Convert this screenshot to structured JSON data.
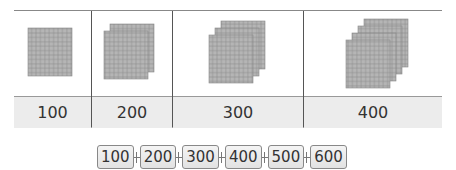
{
  "table": {
    "columns": [
      {
        "label": "100",
        "flats": 1
      },
      {
        "label": "200",
        "flats": 2
      },
      {
        "label": "300",
        "flats": 3
      },
      {
        "label": "400",
        "flats": 4
      }
    ]
  },
  "number_chain": [
    "100",
    "200",
    "300",
    "400",
    "500",
    "600"
  ],
  "colors": {
    "block_fill": "#b5b5b5",
    "grid_line": "#8a8a8a",
    "label_row_bg": "#ececec"
  }
}
